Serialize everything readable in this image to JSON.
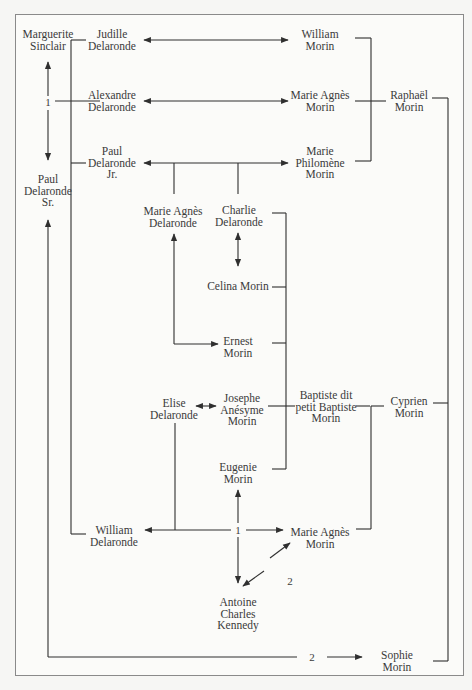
{
  "diagram": {
    "type": "family-tree",
    "nodes": {
      "marguerite_sinclair": {
        "lines": [
          "Marguerite",
          "Sinclair"
        ]
      },
      "paul_delaronde_sr": {
        "lines": [
          "Paul",
          "Delaronde",
          "Sr."
        ]
      },
      "judille_delaronde": {
        "lines": [
          "Judille",
          "Delaronde"
        ]
      },
      "alexandre_delaronde": {
        "lines": [
          "Alexandre",
          "Delaronde"
        ]
      },
      "paul_delaronde_jr": {
        "lines": [
          "Paul",
          "Delaronde",
          "Jr."
        ]
      },
      "william_morin": {
        "lines": [
          "William",
          "Morin"
        ]
      },
      "marie_agnes_morin_top": {
        "lines": [
          "Marie Agnès",
          "Morin"
        ]
      },
      "marie_philomene_morin": {
        "lines": [
          "Marie",
          "Philomène",
          "Morin"
        ]
      },
      "raphael_morin": {
        "lines": [
          "Raphaël",
          "Morin"
        ]
      },
      "marie_agnes_delaronde": {
        "lines": [
          "Marie Agnès",
          "Delaronde"
        ]
      },
      "charlie_delaronde": {
        "lines": [
          "Charlie",
          "Delaronde"
        ]
      },
      "celina_morin": {
        "lines": [
          "Celina Morin"
        ]
      },
      "ernest_morin": {
        "lines": [
          "Ernest",
          "Morin"
        ]
      },
      "elise_delaronde": {
        "lines": [
          "Elise",
          "Delaronde"
        ]
      },
      "josephe_anesyme_morin": {
        "lines": [
          "Josephe",
          "Anésyme",
          "Morin"
        ]
      },
      "baptiste_morin": {
        "lines": [
          "Baptiste dit",
          "petit Baptiste",
          "Morin"
        ]
      },
      "cyprien_morin": {
        "lines": [
          "Cyprien",
          "Morin"
        ]
      },
      "eugenie_morin": {
        "lines": [
          "Eugenie",
          "Morin"
        ]
      },
      "william_delaronde": {
        "lines": [
          "William",
          "Delaronde"
        ]
      },
      "marie_agnes_morin_bottom": {
        "lines": [
          "Marie Agnès",
          "Morin"
        ]
      },
      "antoine_charles_kennedy": {
        "lines": [
          "Antoine",
          "Charles",
          "Kennedy"
        ]
      },
      "sophie_morin": {
        "lines": [
          "Sophie",
          "Morin"
        ]
      }
    },
    "marriage_labels": {
      "sinclair_paul_sr": "1",
      "william_marie_agnes": "1",
      "marie_agnes_antoine": "2",
      "paul_sr_sophie": "2"
    },
    "colors": {
      "line": "#2f2f2f",
      "text": "#3a3a3a",
      "frame": "#8a8a8a",
      "background": "#fbfbf9"
    }
  }
}
